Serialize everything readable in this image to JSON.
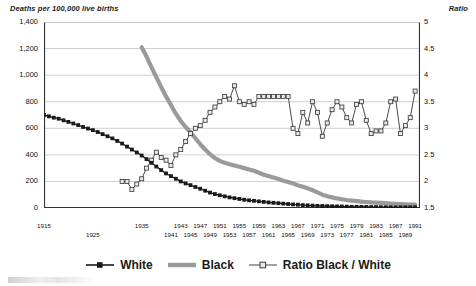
{
  "chart_data": {
    "type": "line",
    "title": "",
    "left_axis_title": "Deaths per 100,000 live births",
    "right_axis_title": "Ratio",
    "xlabel": "",
    "grid": true,
    "legend_position": "bottom",
    "xlim": [
      1915,
      1992
    ],
    "ylim": [
      0,
      1400
    ],
    "y2lim": [
      1.5,
      5
    ],
    "left_ticks": [
      "0",
      "200",
      "400",
      "600",
      "800",
      "1,000",
      "1,200",
      "1,400"
    ],
    "left_tick_values": [
      0,
      200,
      400,
      600,
      800,
      1000,
      1200,
      1400
    ],
    "right_ticks": [
      "1.5",
      "2",
      "2.5",
      "3",
      "3.5",
      "4",
      "4.5",
      "5"
    ],
    "right_tick_values": [
      1.5,
      2,
      2.5,
      3,
      3.5,
      4,
      4.5,
      5
    ],
    "x_tick_labels_row1": [
      "1915",
      "1935",
      "1943",
      "1947",
      "1951",
      "1955",
      "1959",
      "1963",
      "1967",
      "1971",
      "1975",
      "1979",
      "1983",
      "1987",
      "1991"
    ],
    "x_tick_labels_row2": [
      "1925",
      "1941",
      "1945",
      "1949",
      "1953",
      "1957",
      "1961",
      "1965",
      "1969",
      "1973",
      "1977",
      "1981",
      "1985",
      "1989"
    ],
    "x_tick_label_years_row1": [
      1915,
      1935,
      1943,
      1947,
      1951,
      1955,
      1959,
      1963,
      1967,
      1971,
      1975,
      1979,
      1983,
      1987,
      1991
    ],
    "x_tick_label_years_row2": [
      1925,
      1941,
      1945,
      1949,
      1953,
      1957,
      1961,
      1965,
      1969,
      1973,
      1977,
      1981,
      1985,
      1989
    ],
    "series": [
      {
        "name": "White",
        "axis": "left",
        "color": "#1a1a1a",
        "marker": "square-filled",
        "x": [
          1915,
          1916,
          1917,
          1918,
          1919,
          1920,
          1921,
          1922,
          1923,
          1924,
          1925,
          1926,
          1927,
          1928,
          1929,
          1930,
          1931,
          1932,
          1933,
          1934,
          1935,
          1936,
          1937,
          1938,
          1939,
          1940,
          1941,
          1942,
          1943,
          1944,
          1945,
          1946,
          1947,
          1948,
          1949,
          1950,
          1951,
          1952,
          1953,
          1954,
          1955,
          1956,
          1957,
          1958,
          1959,
          1960,
          1961,
          1962,
          1963,
          1964,
          1965,
          1966,
          1967,
          1968,
          1969,
          1970,
          1971,
          1972,
          1973,
          1974,
          1975,
          1976,
          1977,
          1978,
          1979,
          1980,
          1981,
          1982,
          1983,
          1984,
          1985,
          1986,
          1987,
          1988,
          1989,
          1990,
          1991
        ],
        "values": [
          700,
          690,
          680,
          672,
          660,
          648,
          636,
          624,
          610,
          598,
          586,
          572,
          556,
          540,
          524,
          505,
          485,
          462,
          440,
          418,
          395,
          368,
          340,
          312,
          285,
          260,
          240,
          220,
          200,
          185,
          172,
          158,
          145,
          130,
          116,
          105,
          96,
          88,
          80,
          74,
          68,
          62,
          58,
          54,
          50,
          46,
          42,
          39,
          36,
          33,
          30,
          27,
          25,
          22,
          20,
          18,
          16,
          15,
          14,
          13,
          12,
          11,
          10,
          9,
          9,
          8,
          8,
          7,
          7,
          6,
          6,
          6,
          5,
          5,
          5,
          5,
          5
        ]
      },
      {
        "name": "Black",
        "axis": "left",
        "color": "#9a9a9a",
        "marker": "none",
        "x": [
          1935,
          1936,
          1937,
          1938,
          1939,
          1940,
          1941,
          1942,
          1943,
          1944,
          1945,
          1946,
          1947,
          1948,
          1949,
          1950,
          1951,
          1952,
          1953,
          1954,
          1955,
          1956,
          1957,
          1958,
          1959,
          1960,
          1961,
          1962,
          1963,
          1964,
          1965,
          1966,
          1967,
          1968,
          1969,
          1970,
          1971,
          1972,
          1973,
          1974,
          1975,
          1976,
          1977,
          1978,
          1979,
          1980,
          1981,
          1982,
          1983,
          1984,
          1985,
          1986,
          1987,
          1988,
          1989,
          1990,
          1991
        ],
        "values": [
          1210,
          1140,
          1060,
          985,
          910,
          840,
          775,
          710,
          655,
          610,
          570,
          525,
          480,
          440,
          405,
          375,
          355,
          340,
          330,
          320,
          310,
          300,
          290,
          280,
          265,
          250,
          240,
          230,
          218,
          205,
          195,
          185,
          172,
          160,
          148,
          134,
          118,
          100,
          88,
          80,
          72,
          66,
          60,
          56,
          52,
          48,
          45,
          42,
          40,
          38,
          36,
          34,
          32,
          30,
          28,
          26,
          25
        ]
      },
      {
        "name": "Ratio Black / White",
        "axis": "right",
        "color": "#3c3c3c",
        "marker": "square-open",
        "x": [
          1931,
          1932,
          1933,
          1934,
          1935,
          1936,
          1937,
          1938,
          1939,
          1940,
          1941,
          1942,
          1943,
          1944,
          1945,
          1946,
          1947,
          1948,
          1949,
          1950,
          1951,
          1952,
          1953,
          1954,
          1955,
          1956,
          1957,
          1958,
          1959,
          1960,
          1961,
          1962,
          1963,
          1964,
          1965,
          1966,
          1967,
          1968,
          1969,
          1970,
          1971,
          1972,
          1973,
          1974,
          1975,
          1976,
          1977,
          1978,
          1979,
          1980,
          1981,
          1982,
          1983,
          1984,
          1985,
          1986,
          1987,
          1988,
          1989,
          1990,
          1991
        ],
        "values": [
          2.0,
          2.0,
          1.85,
          1.95,
          2.05,
          2.25,
          2.4,
          2.55,
          2.45,
          2.4,
          2.3,
          2.5,
          2.6,
          2.75,
          2.9,
          3.0,
          3.05,
          3.15,
          3.3,
          3.4,
          3.5,
          3.6,
          3.55,
          3.8,
          3.5,
          3.45,
          3.5,
          3.45,
          3.6,
          3.6,
          3.6,
          3.6,
          3.6,
          3.6,
          3.6,
          3.0,
          2.9,
          3.3,
          3.1,
          3.5,
          3.3,
          2.85,
          3.1,
          3.35,
          3.5,
          3.4,
          3.2,
          3.1,
          3.45,
          3.5,
          3.15,
          2.9,
          2.95,
          2.95,
          3.1,
          3.5,
          3.55,
          2.9,
          3.05,
          3.2,
          3.7
        ]
      }
    ]
  },
  "legend": {
    "items": [
      {
        "label": "White",
        "swatch": "line-square-dark"
      },
      {
        "label": "Black",
        "swatch": "line-thick-gray"
      },
      {
        "label": "Ratio Black / White",
        "swatch": "line-square-open"
      }
    ]
  }
}
